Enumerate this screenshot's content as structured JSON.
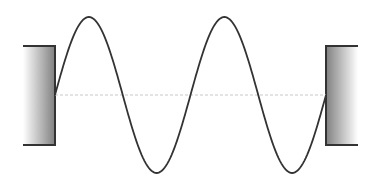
{
  "diagram": {
    "type": "standing-wave-between-fixed-walls",
    "canvas": {
      "width": 381,
      "height": 184
    },
    "colors": {
      "background": "#ffffff",
      "wave": "#333333",
      "wall_border": "#333333",
      "wall_gradient_dark": "#808080",
      "wall_gradient_light": "#ffffff",
      "baseline": "#c8c8c8"
    },
    "left_wall": {
      "x": 23,
      "y": 46,
      "width": 32,
      "height": 99
    },
    "right_wall": {
      "x": 326,
      "y": 46,
      "width": 32,
      "height": 99
    },
    "baseline": {
      "y": 95,
      "x1": 55,
      "x2": 326,
      "style": "dashed"
    },
    "wave": {
      "x_start": 55,
      "x_end": 326,
      "center_y": 95,
      "amplitude": 78,
      "periods": 2,
      "peaks": [
        {
          "x": 100,
          "y": 17
        },
        {
          "x": 281,
          "y": 17
        }
      ],
      "troughs": [
        {
          "x": 190,
          "y": 173
        }
      ],
      "nodes_x": [
        55,
        145,
        236,
        326
      ]
    }
  }
}
